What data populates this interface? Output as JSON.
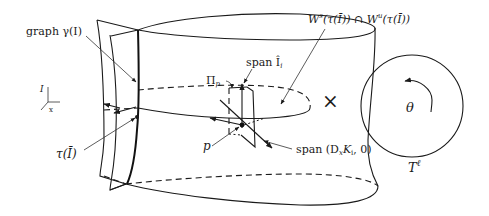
{
  "labels": {
    "graph": "graph γ(I)",
    "axis_I": "I",
    "axis_x": "x",
    "tau": "τ(Ī)",
    "pi_p": "Π",
    "pi_sub": "p",
    "span_I": "span Î",
    "span_I_sub": "i",
    "intersection_W": "W",
    "intersection_s": "s",
    "intersection_mid": "(τ(Ī)) ∩ W",
    "intersection_u": "u",
    "intersection_end": "(τ(Ī))",
    "point_p": "p",
    "span_D": "span (D",
    "span_D_sub": "x",
    "span_D_K": "K",
    "span_D_K_sub": "i",
    "span_D_end": ", 0)",
    "times": "×",
    "theta": "θ",
    "torus": "T",
    "torus_sup": "ℓ"
  },
  "colors": {
    "ink": "#1a1a1a",
    "background": "#ffffff"
  }
}
